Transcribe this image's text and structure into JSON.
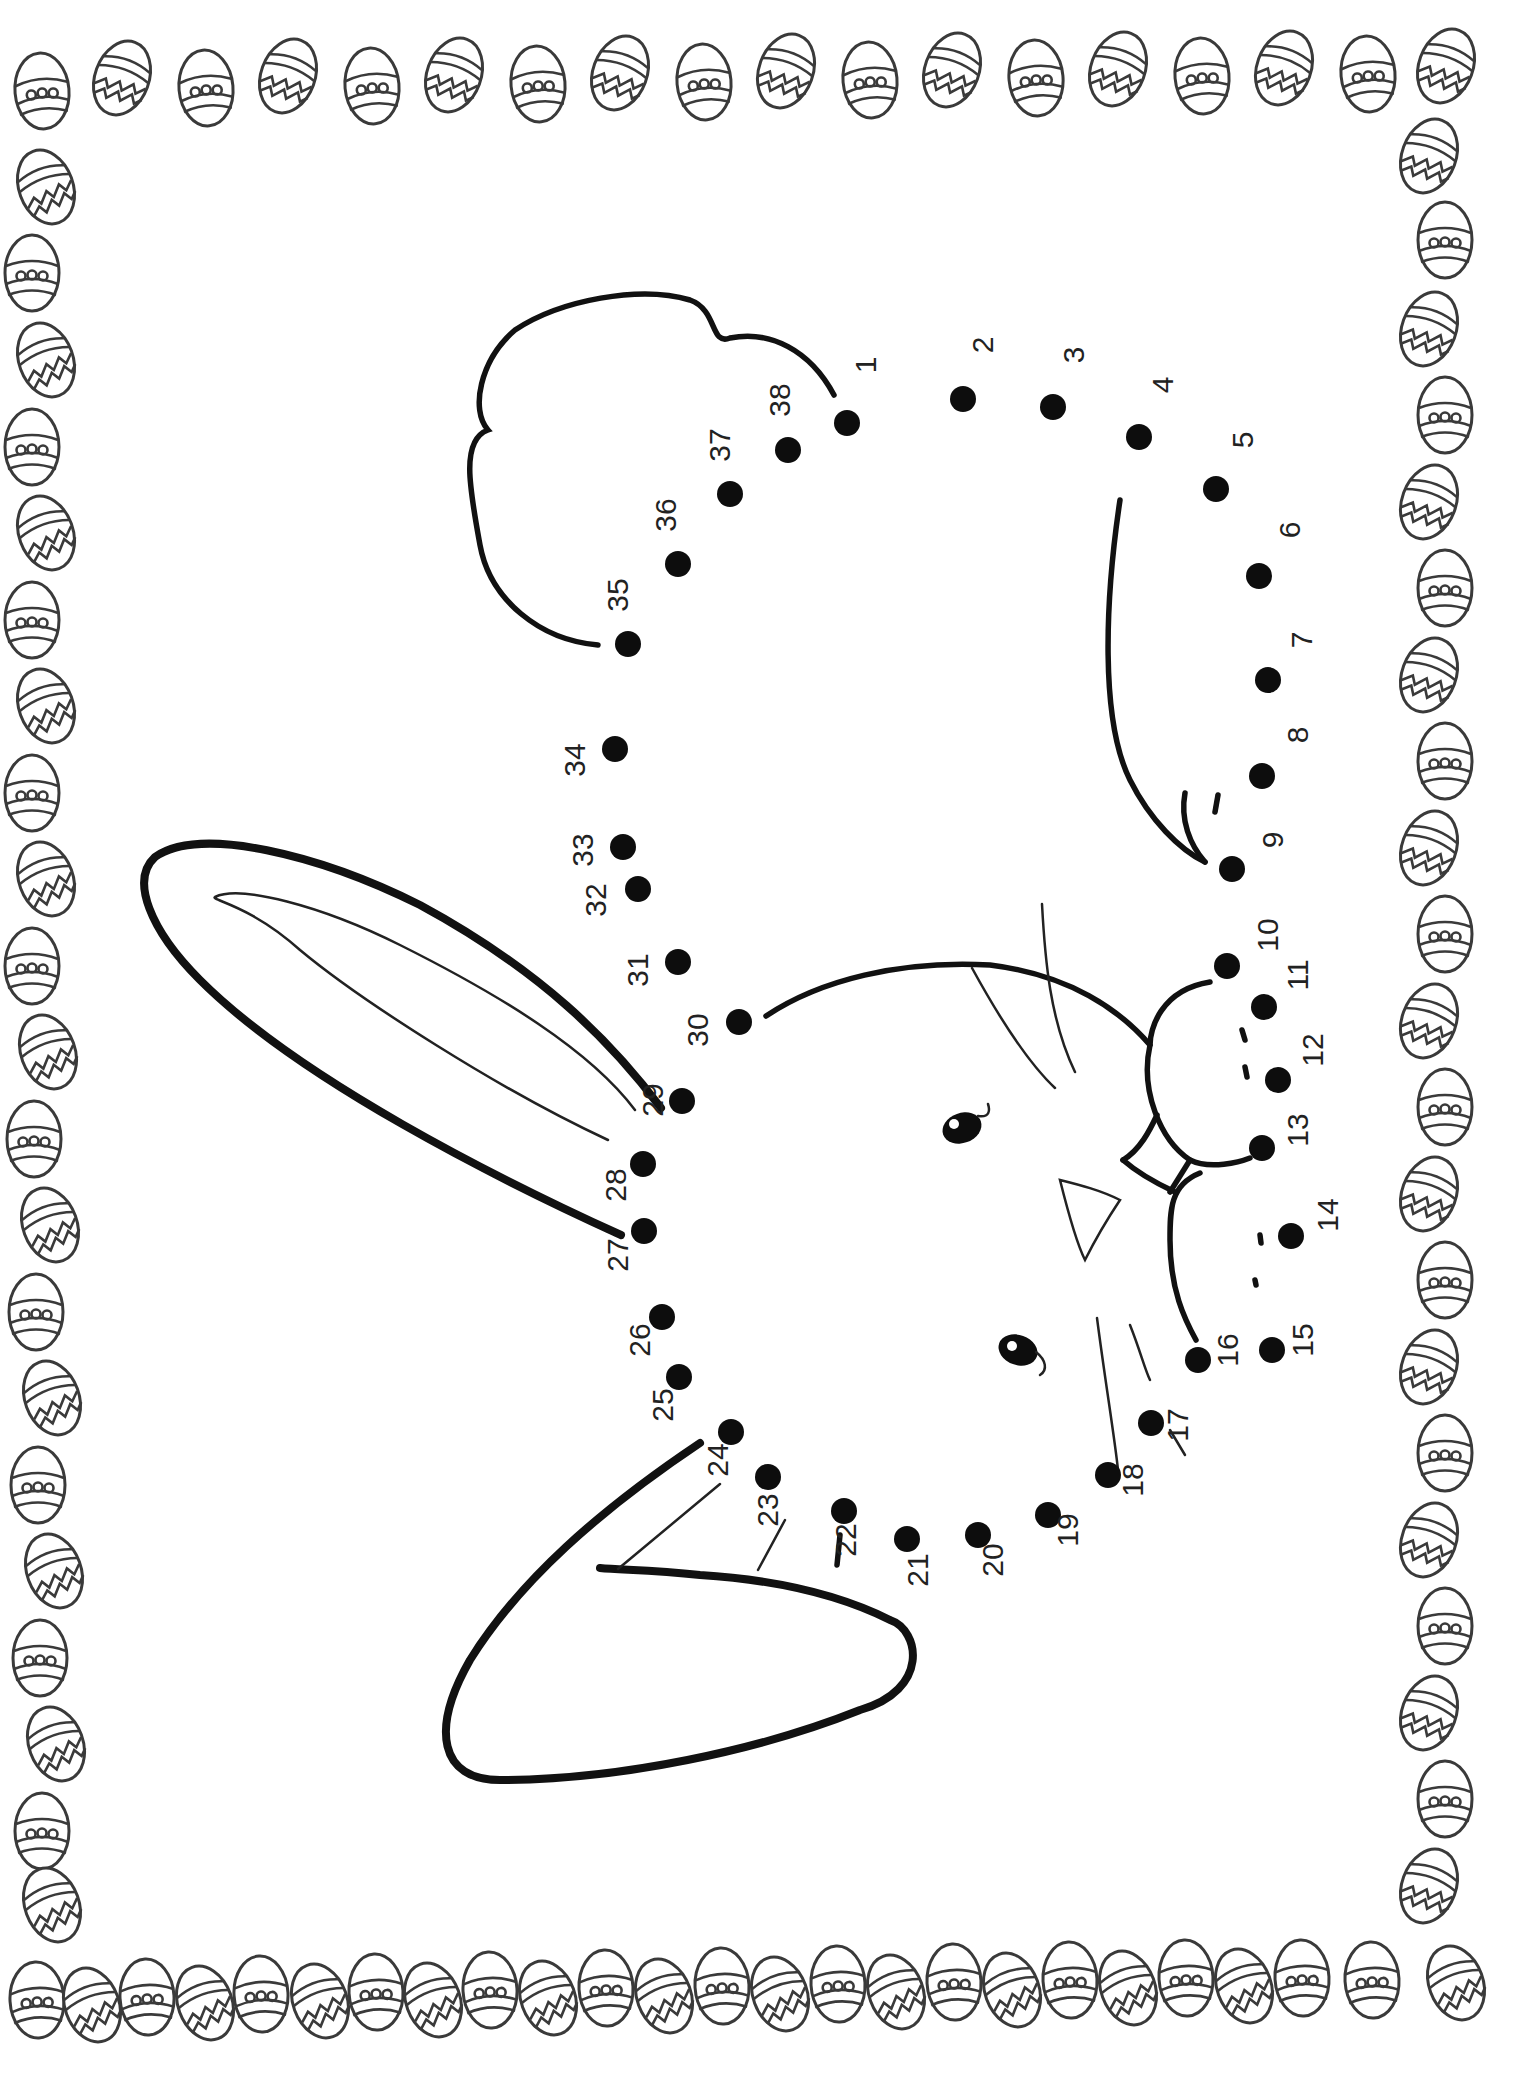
{
  "worksheet": {
    "subject": "bunny",
    "theme": "easter-eggs",
    "dots": [
      {
        "n": "1",
        "x": 847,
        "y": 423,
        "lx": 868,
        "ly": 365
      },
      {
        "n": "2",
        "x": 963,
        "y": 399,
        "lx": 985,
        "ly": 345
      },
      {
        "n": "3",
        "x": 1053,
        "y": 407,
        "lx": 1076,
        "ly": 355
      },
      {
        "n": "4",
        "x": 1139,
        "y": 437,
        "lx": 1165,
        "ly": 385
      },
      {
        "n": "5",
        "x": 1216,
        "y": 489,
        "lx": 1245,
        "ly": 440
      },
      {
        "n": "6",
        "x": 1259,
        "y": 576,
        "lx": 1292,
        "ly": 530
      },
      {
        "n": "7",
        "x": 1268,
        "y": 680,
        "lx": 1304,
        "ly": 640
      },
      {
        "n": "8",
        "x": 1262,
        "y": 776,
        "lx": 1300,
        "ly": 735
      },
      {
        "n": "9",
        "x": 1232,
        "y": 869,
        "lx": 1275,
        "ly": 840
      },
      {
        "n": "10",
        "x": 1227,
        "y": 966,
        "lx": 1270,
        "ly": 935
      },
      {
        "n": "11",
        "x": 1264,
        "y": 1007,
        "lx": 1300,
        "ly": 975
      },
      {
        "n": "12",
        "x": 1278,
        "y": 1080,
        "lx": 1315,
        "ly": 1050
      },
      {
        "n": "13",
        "x": 1262,
        "y": 1148,
        "lx": 1300,
        "ly": 1130
      },
      {
        "n": "14",
        "x": 1291,
        "y": 1236,
        "lx": 1330,
        "ly": 1215
      },
      {
        "n": "15",
        "x": 1272,
        "y": 1350,
        "lx": 1305,
        "ly": 1340
      },
      {
        "n": "16",
        "x": 1198,
        "y": 1360,
        "lx": 1230,
        "ly": 1350
      },
      {
        "n": "17",
        "x": 1151,
        "y": 1423,
        "lx": 1180,
        "ly": 1425
      },
      {
        "n": "18",
        "x": 1108,
        "y": 1475,
        "lx": 1135,
        "ly": 1480
      },
      {
        "n": "19",
        "x": 1048,
        "y": 1515,
        "lx": 1070,
        "ly": 1530
      },
      {
        "n": "20",
        "x": 978,
        "y": 1535,
        "lx": 995,
        "ly": 1560
      },
      {
        "n": "21",
        "x": 907,
        "y": 1539,
        "lx": 920,
        "ly": 1570
      },
      {
        "n": "22",
        "x": 844,
        "y": 1511,
        "lx": 848,
        "ly": 1540
      },
      {
        "n": "23",
        "x": 768,
        "y": 1477,
        "lx": 770,
        "ly": 1510
      },
      {
        "n": "24",
        "x": 731,
        "y": 1432,
        "lx": 720,
        "ly": 1460
      },
      {
        "n": "25",
        "x": 679,
        "y": 1377,
        "lx": 665,
        "ly": 1405
      },
      {
        "n": "26",
        "x": 662,
        "y": 1317,
        "lx": 642,
        "ly": 1340
      },
      {
        "n": "27",
        "x": 644,
        "y": 1231,
        "lx": 620,
        "ly": 1255
      },
      {
        "n": "28",
        "x": 643,
        "y": 1164,
        "lx": 618,
        "ly": 1185
      },
      {
        "n": "29",
        "x": 682,
        "y": 1101,
        "lx": 655,
        "ly": 1100
      },
      {
        "n": "30",
        "x": 739,
        "y": 1022,
        "lx": 700,
        "ly": 1030
      },
      {
        "n": "31",
        "x": 678,
        "y": 962,
        "lx": 640,
        "ly": 970
      },
      {
        "n": "32",
        "x": 638,
        "y": 889,
        "lx": 598,
        "ly": 900
      },
      {
        "n": "33",
        "x": 623,
        "y": 847,
        "lx": 585,
        "ly": 850
      },
      {
        "n": "34",
        "x": 615,
        "y": 749,
        "lx": 577,
        "ly": 760
      },
      {
        "n": "35",
        "x": 628,
        "y": 644,
        "lx": 620,
        "ly": 595
      },
      {
        "n": "36",
        "x": 678,
        "y": 564,
        "lx": 668,
        "ly": 515
      },
      {
        "n": "37",
        "x": 730,
        "y": 494,
        "lx": 722,
        "ly": 445
      },
      {
        "n": "38",
        "x": 788,
        "y": 450,
        "lx": 782,
        "ly": 400
      }
    ]
  }
}
